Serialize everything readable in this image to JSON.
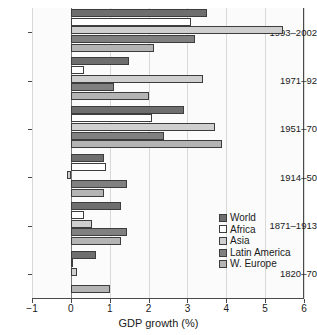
{
  "chart_data": {
    "type": "bar",
    "orientation": "horizontal",
    "title": "",
    "xlabel": "GDP growth (%)",
    "ylabel": "",
    "xlim": [
      -1,
      6
    ],
    "xticks": [
      -1,
      0,
      1,
      2,
      3,
      4,
      5,
      6
    ],
    "xticklabels": [
      "−1",
      "0",
      "1",
      "2",
      "3",
      "4",
      "5",
      "6"
    ],
    "grid": "vertical",
    "legend_position": "center-right",
    "categories": [
      "1993–2002",
      "1971–92",
      "1951–70",
      "1914–50",
      "1871–1913",
      "1820–70"
    ],
    "series": [
      {
        "name": "World",
        "color": "#6e6e6e",
        "values": [
          3.5,
          1.5,
          2.9,
          0.85,
          1.3,
          0.65
        ]
      },
      {
        "name": "Africa",
        "color": "#ffffff",
        "values": [
          3.1,
          0.35,
          2.1,
          0.9,
          0.35,
          0.05
        ]
      },
      {
        "name": "Asia",
        "color": "#cfcfcf",
        "values": [
          5.45,
          3.4,
          3.7,
          -0.1,
          0.55,
          0.15
        ]
      },
      {
        "name": "Latin America",
        "color": "#808080",
        "values": [
          3.2,
          1.1,
          2.4,
          1.45,
          1.45,
          null
        ]
      },
      {
        "name": "W. Europe",
        "color": "#b4b4b4",
        "values": [
          2.15,
          2.0,
          3.9,
          0.85,
          1.3,
          1.0
        ]
      }
    ]
  },
  "legend": {
    "items": [
      {
        "label": "World",
        "color": "#6e6e6e"
      },
      {
        "label": "Africa",
        "color": "#ffffff"
      },
      {
        "label": "Asia",
        "color": "#cfcfcf"
      },
      {
        "label": "Latin America",
        "color": "#808080"
      },
      {
        "label": "W. Europe",
        "color": "#b4b4b4"
      }
    ]
  },
  "axis": {
    "x_title": "GDP growth (%)",
    "tick_labels": [
      "−1",
      "0",
      "1",
      "2",
      "3",
      "4",
      "5",
      "6"
    ]
  },
  "groups": [
    "1993–2002",
    "1971–92",
    "1951–70",
    "1914–50",
    "1871–1913",
    "1820–70"
  ]
}
